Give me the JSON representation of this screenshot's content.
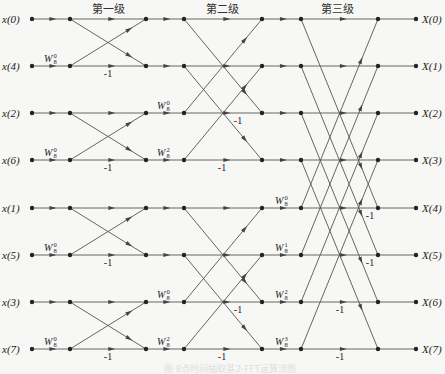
{
  "stages": [
    {
      "title": "第一级",
      "x": 108
    },
    {
      "title": "第二级",
      "x": 222
    },
    {
      "title": "第三级",
      "x": 337
    }
  ],
  "inputs": [
    "x(0)",
    "x(4)",
    "x(2)",
    "x(6)",
    "x(1)",
    "x(5)",
    "x(3)",
    "x(7)"
  ],
  "outputs": [
    "X(0)",
    "X(1)",
    "X(2)",
    "X(3)",
    "X(4)",
    "X(5)",
    "X(6)",
    "X(7)"
  ],
  "layout": {
    "row_y": [
      19,
      66,
      113,
      160,
      208,
      255,
      302,
      349
    ],
    "col_x": [
      32,
      70,
      146,
      184,
      262,
      301,
      378,
      416
    ],
    "line_color": "#555555",
    "node_color": "#222222"
  },
  "twiddles": [
    {
      "stage": 1,
      "row": 1,
      "label": "W",
      "sub": "8",
      "sup": "0"
    },
    {
      "stage": 1,
      "row": 3,
      "label": "W",
      "sub": "8",
      "sup": "0"
    },
    {
      "stage": 1,
      "row": 5,
      "label": "W",
      "sub": "8",
      "sup": "0"
    },
    {
      "stage": 1,
      "row": 7,
      "label": "W",
      "sub": "8",
      "sup": "0"
    },
    {
      "stage": 2,
      "row": 2,
      "label": "W",
      "sub": "8",
      "sup": "0"
    },
    {
      "stage": 2,
      "row": 3,
      "label": "W",
      "sub": "8",
      "sup": "2"
    },
    {
      "stage": 2,
      "row": 6,
      "label": "W",
      "sub": "8",
      "sup": "0"
    },
    {
      "stage": 2,
      "row": 7,
      "label": "W",
      "sub": "8",
      "sup": "2"
    },
    {
      "stage": 3,
      "row": 4,
      "label": "W",
      "sub": "8",
      "sup": "0"
    },
    {
      "stage": 3,
      "row": 5,
      "label": "W",
      "sub": "8",
      "sup": "1"
    },
    {
      "stage": 3,
      "row": 6,
      "label": "W",
      "sub": "8",
      "sup": "2"
    },
    {
      "stage": 3,
      "row": 7,
      "label": "W",
      "sub": "8",
      "sup": "3"
    }
  ],
  "minus_one_label": "-1",
  "minus_ones": [
    {
      "stage": 1,
      "row": 1,
      "x": 108
    },
    {
      "stage": 1,
      "row": 3,
      "x": 108
    },
    {
      "stage": 1,
      "row": 5,
      "x": 108
    },
    {
      "stage": 1,
      "row": 7,
      "x": 108
    },
    {
      "stage": 2,
      "row": 2,
      "x": 238
    },
    {
      "stage": 2,
      "row": 3,
      "x": 222
    },
    {
      "stage": 2,
      "row": 6,
      "x": 238
    },
    {
      "stage": 2,
      "row": 7,
      "x": 222
    },
    {
      "stage": 3,
      "row": 4,
      "x": 370
    },
    {
      "stage": 3,
      "row": 5,
      "x": 370
    },
    {
      "stage": 3,
      "row": 6,
      "x": 340
    },
    {
      "stage": 3,
      "row": 7,
      "x": 340
    }
  ],
  "butterfly_spans": [
    1,
    2,
    4
  ],
  "caption": "图 8点时间抽取基2-FFT运算流图"
}
